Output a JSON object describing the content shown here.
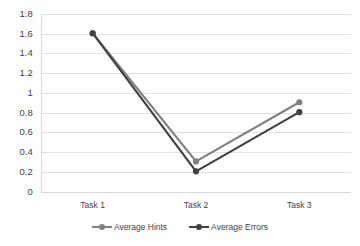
{
  "chart_data": {
    "type": "line",
    "title": "",
    "subtitle": "",
    "xlabel": "",
    "ylabel": "",
    "categories": [
      "Task 1",
      "Task 2",
      "Task 3"
    ],
    "series": [
      {
        "name": "Average Hints",
        "values": [
          1.61,
          0.31,
          0.91
        ],
        "color": "#808080"
      },
      {
        "name": "Average Errors",
        "values": [
          1.61,
          0.21,
          0.81
        ],
        "color": "#404040"
      }
    ],
    "ylim": [
      0,
      1.8
    ],
    "ytick_values": [
      0,
      0.2,
      0.4,
      0.6,
      0.8,
      1,
      1.2,
      1.4,
      1.6,
      1.8
    ],
    "ytick_labels": [
      "0",
      "0.2",
      "0.4",
      "0.6",
      "0.8",
      "1",
      "1.2",
      "1.4",
      "1.6",
      "1.8"
    ],
    "grid": true,
    "grid_axis": "y",
    "grid_color": "#d9d9d9",
    "legend_position": "bottom",
    "marker": "circle",
    "background": "#ffffff"
  },
  "legend": {
    "entries": [
      {
        "label": "Average Hints"
      },
      {
        "label": "Average Errors"
      }
    ]
  }
}
